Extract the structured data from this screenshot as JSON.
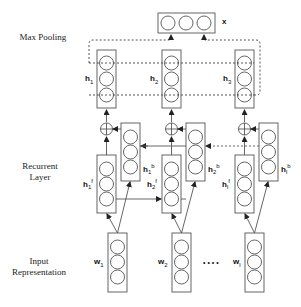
{
  "layers": {
    "pooling": "Max Pooling",
    "recurrent": "Recurrent Layer",
    "input": "Input Representation"
  },
  "labels": {
    "output": "x",
    "h1": {
      "base": "h",
      "sub": "1"
    },
    "h2": {
      "base": "h",
      "sub": "2"
    },
    "h3": {
      "base": "h",
      "sub": "3"
    },
    "h1f": {
      "base": "h",
      "sub": "1",
      "sup": "f"
    },
    "h2f": {
      "base": "h",
      "sub": "2",
      "sup": "f"
    },
    "hlf": {
      "base": "h",
      "sub": "l",
      "sup": "f"
    },
    "h1b": {
      "base": "h",
      "sub": "1",
      "sup": "b"
    },
    "h2b": {
      "base": "h",
      "sub": "2",
      "sup": "b"
    },
    "hlb": {
      "base": "h",
      "sub": "l",
      "sup": "b"
    },
    "w1": {
      "base": "w",
      "sub": "1"
    },
    "w2": {
      "base": "w",
      "sub": "2"
    },
    "wl": {
      "base": "w",
      "sub": "l"
    },
    "ellipsis": "• • • •"
  },
  "colors": {
    "stroke": "#555555",
    "text": "#111111"
  }
}
